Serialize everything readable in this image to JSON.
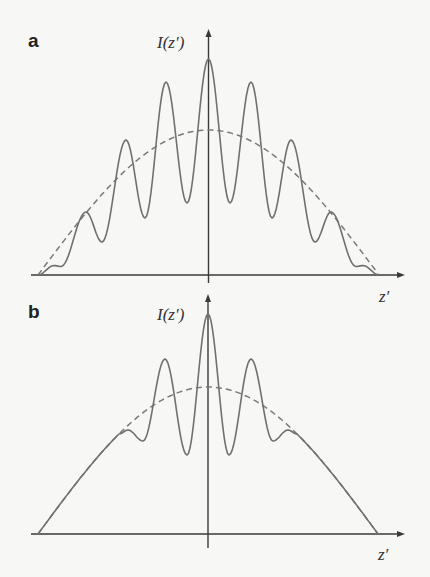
{
  "figure": {
    "panels": [
      {
        "id": "a",
        "letter": "a",
        "ylabel": "I(z′)",
        "xlabel": "z′"
      },
      {
        "id": "b",
        "letter": "b",
        "ylabel": "I(z′)",
        "xlabel": "z′"
      }
    ]
  },
  "colors": {
    "axis": "#3a3a3a",
    "curve": "#707070",
    "envelope": "#7a7a7a",
    "background": "#f7f7f5"
  },
  "chart_data": [
    {
      "type": "line",
      "title": "a",
      "xlabel": "z′",
      "ylabel": "I(z′)",
      "grid": false,
      "legend": null,
      "axis_px": {
        "x0": 31,
        "x1": 405,
        "baseline": 275,
        "center": 208.5,
        "y_top": 29,
        "y_bottom": 283
      },
      "label_px": {
        "letter": [
          28,
          47
        ],
        "ylabel": [
          157,
          48
        ],
        "xlabel": [
          379,
          302
        ]
      },
      "envelope": {
        "style": "dashed",
        "shape": "cosine",
        "center": 208.5,
        "half_width": 170.5,
        "baseline": 275,
        "peak_y": 130
      },
      "series": [
        {
          "name": "intensity (solid)",
          "half_extrema_px": [
            [
              38,
              275
            ],
            [
              54,
              265.5
            ],
            [
              61,
              266.5
            ],
            [
              86,
              212
            ],
            [
              102,
              242
            ],
            [
              126,
              140
            ],
            [
              145,
              218
            ],
            [
              166,
              82
            ],
            [
              187,
              203
            ],
            [
              208.5,
              59
            ]
          ],
          "symmetric": true
        }
      ],
      "relative_values": {
        "x_positions_from_center": [
          0,
          42.5,
          82.5,
          122.5
        ],
        "peak_heights": [
          216,
          193,
          135,
          63
        ],
        "valley_heights": [
          72,
          57,
          33
        ],
        "envelope_max": 145
      }
    },
    {
      "type": "line",
      "title": "b",
      "xlabel": "z′",
      "ylabel": "I(z′)",
      "grid": false,
      "legend": null,
      "axis_px": {
        "x0": 31,
        "x1": 405,
        "baseline": 534,
        "center": 208,
        "y_top": 294,
        "y_bottom": 548
      },
      "label_px": {
        "letter": [
          28,
          318
        ],
        "ylabel": [
          157,
          320
        ],
        "xlabel": [
          378,
          560
        ]
      },
      "envelope": {
        "style": "dashed",
        "shape": "cosine",
        "center": 208,
        "half_width": 170,
        "baseline": 534,
        "peak_y": 387
      },
      "series": [
        {
          "name": "intensity (solid)",
          "follows_envelope_until_x": 119,
          "half_extrema_px": [
            [
              128,
              430
            ],
            [
              143,
              441
            ],
            [
              165,
              359
            ],
            [
              187,
              455
            ],
            [
              208,
              314
            ]
          ],
          "symmetric": true
        }
      ],
      "relative_values": {
        "x_positions_from_center": [
          0,
          43,
          80
        ],
        "peak_heights": [
          220,
          175,
          104
        ],
        "valley_heights": [
          79,
          93
        ],
        "envelope_max": 147
      }
    }
  ]
}
